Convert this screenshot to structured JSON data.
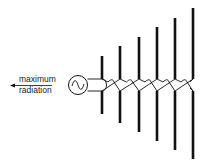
{
  "diagram": {
    "label_line1": "maximum",
    "label_line2": "radiation",
    "source_icon": "ac-source-icon",
    "arrow_icon": "arrow-left-icon",
    "element_count": 6,
    "colors": {
      "ink": "#111111",
      "background": "#ffffff"
    }
  }
}
